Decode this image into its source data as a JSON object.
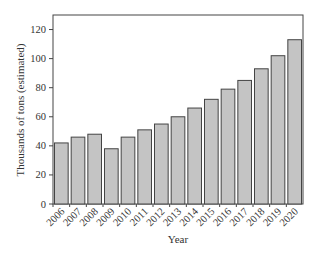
{
  "chart_data": {
    "type": "bar",
    "title": "",
    "xlabel": "Year",
    "ylabel": "Thousands of tons (estimated)",
    "categories": [
      "2006",
      "2007",
      "2008",
      "2009",
      "2010",
      "2011",
      "2012",
      "2013",
      "2014",
      "2015",
      "2016",
      "2017",
      "2018",
      "2019",
      "2020"
    ],
    "values": [
      42,
      46,
      48,
      38,
      46,
      51,
      55,
      60,
      66,
      72,
      79,
      85,
      93,
      102,
      113
    ],
    "ylim": [
      0,
      130
    ],
    "yticks": [
      0,
      20,
      40,
      60,
      80,
      100,
      120
    ],
    "grid": false,
    "legend": null,
    "colors": {
      "bar_fill": "#c4c4c4",
      "bar_stroke": "#444444",
      "axis": "#444444"
    }
  }
}
